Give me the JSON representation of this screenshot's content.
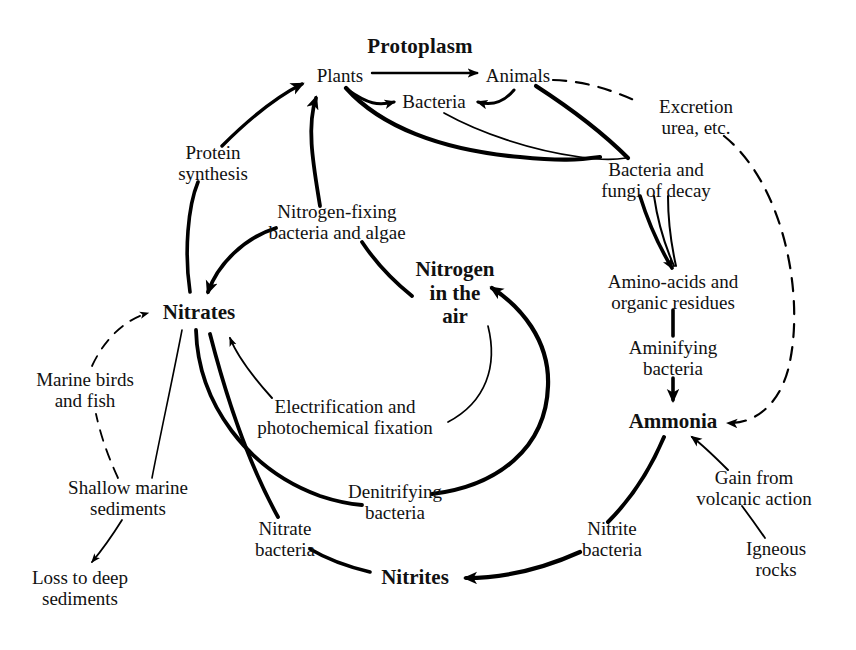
{
  "diagram": {
    "title": "Protoplasm",
    "domain_kind": "nitrogen-cycle-flow-diagram",
    "background_color": "#ffffff",
    "line_color": "#000000",
    "nodes": [
      {
        "id": "protoplasm",
        "label": "Protoplasm",
        "x": 420,
        "y": 47,
        "style": "title"
      },
      {
        "id": "plants",
        "label": "Plants",
        "x": 340,
        "y": 76,
        "style": "reg"
      },
      {
        "id": "animals",
        "label": "Animals",
        "x": 518,
        "y": 76,
        "style": "reg"
      },
      {
        "id": "bacteria",
        "label": "Bacteria",
        "x": 434,
        "y": 102,
        "style": "reg"
      },
      {
        "id": "excretion",
        "label": "Excretion\nurea, etc.",
        "x": 696,
        "y": 117,
        "style": "reg"
      },
      {
        "id": "protein",
        "label": "Protein\nsynthesis",
        "x": 213,
        "y": 163,
        "style": "reg"
      },
      {
        "id": "decay",
        "label": "Bacteria and\nfungi of decay",
        "x": 656,
        "y": 180,
        "style": "reg"
      },
      {
        "id": "nfixing",
        "label": "Nitrogen-fixing\nbacteria and algae",
        "x": 337,
        "y": 222,
        "style": "reg"
      },
      {
        "id": "nair",
        "label": "Nitrogen\nin the\nair",
        "x": 455,
        "y": 293,
        "style": "bold"
      },
      {
        "id": "amino",
        "label": "Amino-acids and\norganic residues",
        "x": 673,
        "y": 292,
        "style": "reg"
      },
      {
        "id": "nitrates",
        "label": "Nitrates",
        "x": 199,
        "y": 313,
        "style": "bold"
      },
      {
        "id": "aminifying",
        "label": "Aminifying\nbacteria",
        "x": 673,
        "y": 358,
        "style": "reg"
      },
      {
        "id": "marinebirds",
        "label": "Marine birds\nand fish",
        "x": 85,
        "y": 390,
        "style": "reg"
      },
      {
        "id": "electrif",
        "label": "Electrification and\nphotochemical fixation",
        "x": 345,
        "y": 417,
        "style": "reg"
      },
      {
        "id": "ammonia",
        "label": "Ammonia",
        "x": 673,
        "y": 422,
        "style": "bold"
      },
      {
        "id": "gainvolcanic",
        "label": "Gain from\nvolcanic action",
        "x": 754,
        "y": 488,
        "style": "reg"
      },
      {
        "id": "shallow",
        "label": "Shallow marine\nsediments",
        "x": 128,
        "y": 498,
        "style": "reg"
      },
      {
        "id": "denitrifying",
        "label": "Denitrifying\nbacteria",
        "x": 395,
        "y": 502,
        "style": "reg"
      },
      {
        "id": "nitratebact",
        "label": "Nitrate\nbacteria",
        "x": 285,
        "y": 539,
        "style": "reg"
      },
      {
        "id": "nitritebact",
        "label": "Nitrite\nbacteria",
        "x": 612,
        "y": 539,
        "style": "reg"
      },
      {
        "id": "igneous",
        "label": "Igneous\nrocks",
        "x": 776,
        "y": 559,
        "style": "reg"
      },
      {
        "id": "nitrites",
        "label": "Nitrites",
        "x": 415,
        "y": 578,
        "style": "bold"
      },
      {
        "id": "lossdeep",
        "label": "Loss to deep\nsediments",
        "x": 80,
        "y": 588,
        "style": "reg"
      }
    ],
    "edges": [
      {
        "id": "plants-to-animals",
        "from": "plants",
        "to": "animals",
        "kind": "solid-thin",
        "arrow": true
      },
      {
        "id": "plants-to-bacteria",
        "from": "plants",
        "to": "bacteria",
        "kind": "solid-med",
        "arrow": true
      },
      {
        "id": "animals-to-bacteria",
        "from": "animals",
        "to": "bacteria",
        "kind": "solid-med",
        "arrow": true
      },
      {
        "id": "animals-to-excretion",
        "from": "animals",
        "to": "excretion",
        "kind": "dashed",
        "arrow": false
      },
      {
        "id": "excretion-to-ammonia",
        "from": "excretion",
        "to": "ammonia",
        "kind": "dashed",
        "arrow": true
      },
      {
        "id": "plants-to-decay",
        "from": "plants",
        "to": "decay",
        "kind": "solid-thick",
        "arrow": false
      },
      {
        "id": "bacteria-to-decay",
        "from": "bacteria",
        "to": "decay",
        "kind": "solid-thin",
        "arrow": false
      },
      {
        "id": "animals-to-decay",
        "from": "animals",
        "to": "decay",
        "kind": "solid-thick",
        "arrow": false
      },
      {
        "id": "decay-to-amino-a",
        "from": "decay",
        "to": "amino",
        "kind": "solid-thick",
        "arrow": true
      },
      {
        "id": "decay-to-amino-b",
        "from": "decay",
        "to": "amino",
        "kind": "solid-thin",
        "arrow": false
      },
      {
        "id": "decay-to-amino-c",
        "from": "decay",
        "to": "amino",
        "kind": "solid-thin",
        "arrow": false
      },
      {
        "id": "amino-to-aminifying",
        "from": "amino",
        "to": "aminifying",
        "kind": "solid-thick",
        "arrow": false
      },
      {
        "id": "aminifying-to-ammonia",
        "from": "aminifying",
        "to": "ammonia",
        "kind": "solid-thick",
        "arrow": true
      },
      {
        "id": "ammonia-to-nitritebact",
        "from": "ammonia",
        "to": "nitritebact",
        "kind": "solid-thick",
        "arrow": false
      },
      {
        "id": "nitritebact-to-nitrites",
        "from": "nitritebact",
        "to": "nitrites",
        "kind": "solid-thick",
        "arrow": true
      },
      {
        "id": "igneous-to-gain",
        "from": "igneous",
        "to": "gainvolcanic",
        "kind": "solid-thin",
        "arrow": false
      },
      {
        "id": "gain-to-ammonia",
        "from": "gainvolcanic",
        "to": "ammonia",
        "kind": "solid-thin",
        "arrow": true
      },
      {
        "id": "nitrites-to-nitratebact",
        "from": "nitrites",
        "to": "nitratebact",
        "kind": "solid-thick",
        "arrow": false
      },
      {
        "id": "nitratebact-to-nitrates",
        "from": "nitratebact",
        "to": "nitrates",
        "kind": "solid-thick",
        "arrow": false
      },
      {
        "id": "nitrates-to-denitrifying",
        "from": "nitrates",
        "to": "denitrifying",
        "kind": "solid-thick",
        "arrow": false
      },
      {
        "id": "denitrifying-to-nair",
        "from": "denitrifying",
        "to": "nair",
        "kind": "solid-thick",
        "arrow": true
      },
      {
        "id": "nair-to-electrif",
        "from": "nair",
        "to": "electrif",
        "kind": "solid-thin",
        "arrow": false
      },
      {
        "id": "electrif-to-nitrates",
        "from": "electrif",
        "to": "nitrates",
        "kind": "solid-thin",
        "arrow": true
      },
      {
        "id": "nair-to-nfixing",
        "from": "nair",
        "to": "nfixing",
        "kind": "solid-thick",
        "arrow": false
      },
      {
        "id": "nfixing-to-plants",
        "from": "nfixing",
        "to": "plants",
        "kind": "solid-thick",
        "arrow": true
      },
      {
        "id": "nfixing-to-nitrates",
        "from": "nfixing",
        "to": "nitrates",
        "kind": "solid-thick",
        "arrow": true
      },
      {
        "id": "nitrates-to-protein",
        "from": "nitrates",
        "to": "protein",
        "kind": "solid-thick",
        "arrow": false
      },
      {
        "id": "protein-to-plants",
        "from": "protein",
        "to": "plants",
        "kind": "solid-thick",
        "arrow": true
      },
      {
        "id": "nitrates-to-shallow",
        "from": "nitrates",
        "to": "shallow",
        "kind": "solid-thin",
        "arrow": false
      },
      {
        "id": "shallow-to-marinebirds",
        "from": "shallow",
        "to": "marinebirds",
        "kind": "dashed",
        "arrow": false
      },
      {
        "id": "marinebirds-to-nitrates",
        "from": "marinebirds",
        "to": "nitrates",
        "kind": "dashed",
        "arrow": true
      },
      {
        "id": "shallow-to-lossdeep",
        "from": "shallow",
        "to": "lossdeep",
        "kind": "solid-thin",
        "arrow": true
      }
    ]
  }
}
